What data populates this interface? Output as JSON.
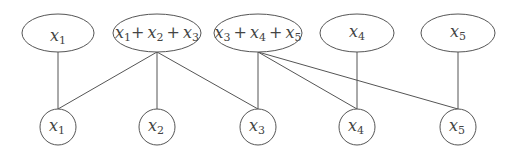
{
  "diagram": {
    "type": "bipartite-graph",
    "top_nodes": [
      {
        "id": "t1",
        "label": "x1",
        "terms": [
          {
            "var": "x",
            "sub": "1"
          }
        ]
      },
      {
        "id": "t2",
        "label": "x1 + x2 + x3",
        "terms": [
          {
            "var": "x",
            "sub": "1"
          },
          {
            "var": "x",
            "sub": "2"
          },
          {
            "var": "x",
            "sub": "3"
          }
        ]
      },
      {
        "id": "t3",
        "label": "x3 + x4 + x5",
        "terms": [
          {
            "var": "x",
            "sub": "3"
          },
          {
            "var": "x",
            "sub": "4"
          },
          {
            "var": "x",
            "sub": "5"
          }
        ]
      },
      {
        "id": "t4",
        "label": "x4",
        "terms": [
          {
            "var": "x",
            "sub": "4"
          }
        ]
      },
      {
        "id": "t5",
        "label": "x5",
        "terms": [
          {
            "var": "x",
            "sub": "5"
          }
        ]
      }
    ],
    "bottom_nodes": [
      {
        "id": "b1",
        "var": "x",
        "sub": "1",
        "label": "x1"
      },
      {
        "id": "b2",
        "var": "x",
        "sub": "2",
        "label": "x2"
      },
      {
        "id": "b3",
        "var": "x",
        "sub": "3",
        "label": "x3"
      },
      {
        "id": "b4",
        "var": "x",
        "sub": "4",
        "label": "x4"
      },
      {
        "id": "b5",
        "var": "x",
        "sub": "5",
        "label": "x5"
      }
    ],
    "edges": [
      [
        "t1",
        "b1"
      ],
      [
        "t2",
        "b1"
      ],
      [
        "t2",
        "b2"
      ],
      [
        "t2",
        "b3"
      ],
      [
        "t3",
        "b3"
      ],
      [
        "t3",
        "b4"
      ],
      [
        "t3",
        "b5"
      ],
      [
        "t4",
        "b4"
      ],
      [
        "t5",
        "b5"
      ]
    ],
    "plus": "+"
  }
}
